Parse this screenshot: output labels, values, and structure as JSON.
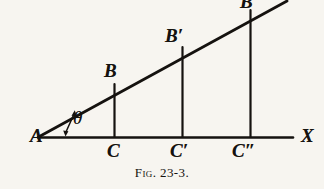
{
  "figure": {
    "caption_prefix": "Fig.",
    "caption_number": "23-3.",
    "caption_full": "Fig. 23-3.",
    "background_color": "#f7f5f0",
    "ink_color": "#15120f"
  },
  "labels": {
    "vertex_a": "A",
    "angle_theta": "θ",
    "point_b": "B",
    "point_b_prime": "B′",
    "point_b_double_prime": "B″",
    "foot_c": "C",
    "foot_c_prime": "C′",
    "foot_c_double_prime": "C″",
    "axis_x": "X"
  },
  "geometry": {
    "vertex_a": [
      38,
      137
    ],
    "axis_end_x": [
      293,
      137
    ],
    "hypotenuse_end": [
      286,
      2
    ],
    "verticals": [
      {
        "name": "BC",
        "x": 114,
        "top": 84,
        "bottom": 137
      },
      {
        "name": "B'C'",
        "x": 182,
        "top": 48,
        "bottom": 137
      },
      {
        "name": "B''C''",
        "x": 250,
        "top": 12,
        "bottom": 137
      }
    ],
    "angle_arrow": {
      "from": [
        66,
        132
      ],
      "to": [
        75,
        113
      ]
    }
  }
}
